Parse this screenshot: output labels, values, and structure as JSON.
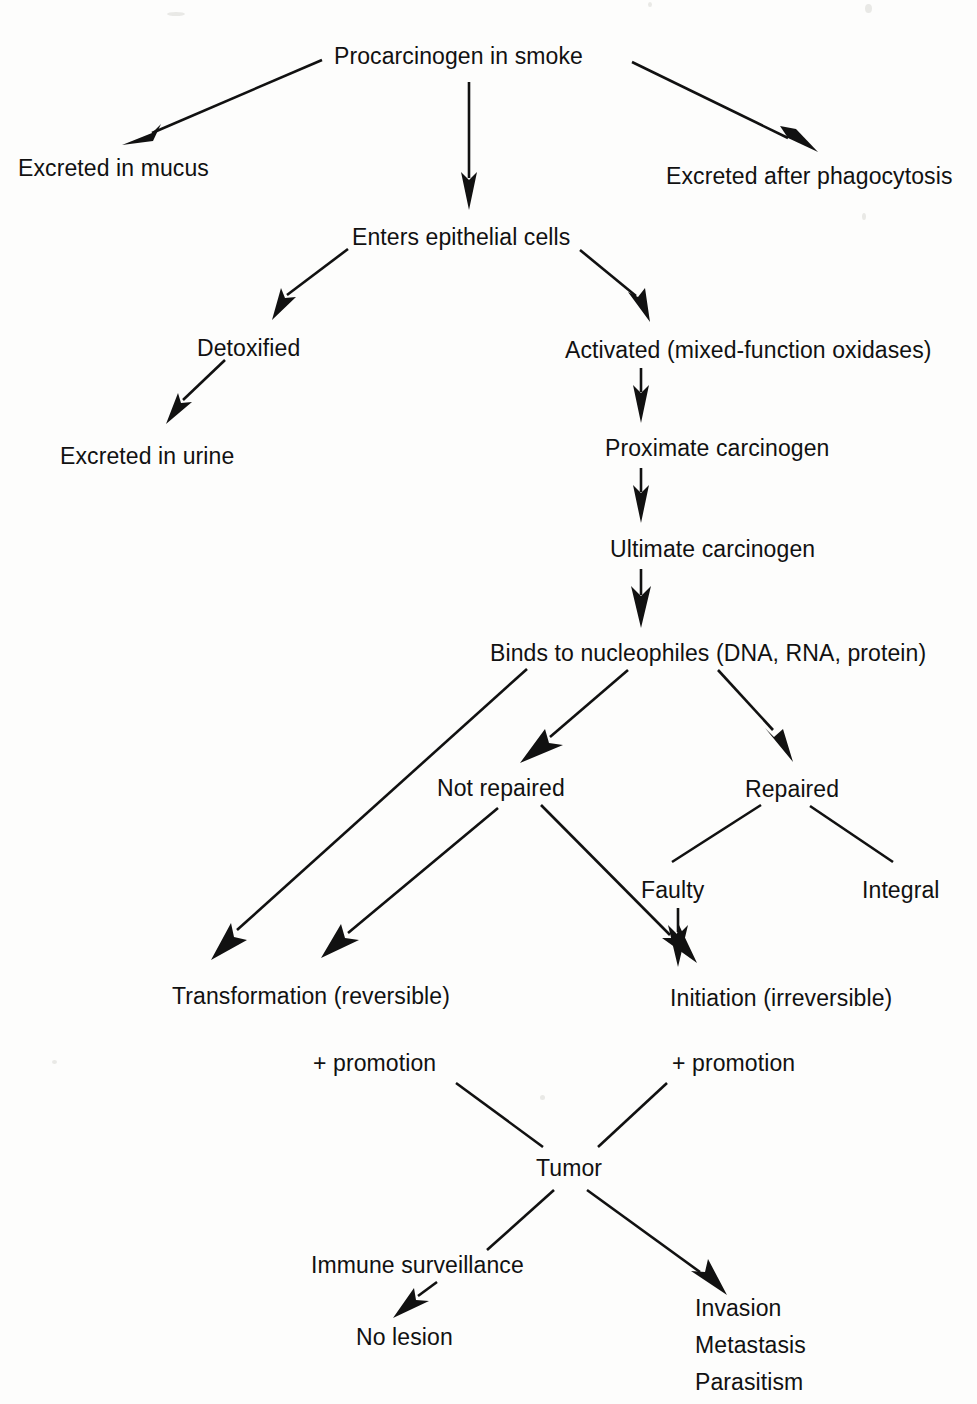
{
  "diagram": {
    "type": "flowchart",
    "ink_color": "#111111",
    "background_color": "#fdfdfc",
    "nodes": [
      {
        "id": "procarcinogen",
        "label": "Procarcinogen in smoke",
        "x": 334,
        "y": 45,
        "anchor": "left"
      },
      {
        "id": "mucus",
        "label": "Excreted in mucus",
        "x": 18,
        "y": 157,
        "anchor": "left"
      },
      {
        "id": "phagocytosis",
        "label": "Excreted after phagocytosis",
        "x": 666,
        "y": 165,
        "anchor": "left"
      },
      {
        "id": "epithelial",
        "label": "Enters epithelial cells",
        "x": 352,
        "y": 226,
        "anchor": "left"
      },
      {
        "id": "detoxified",
        "label": "Detoxified",
        "x": 197,
        "y": 337,
        "anchor": "left"
      },
      {
        "id": "activated",
        "label": "Activated (mixed-function oxidases)",
        "x": 565,
        "y": 339,
        "anchor": "left"
      },
      {
        "id": "urine",
        "label": "Excreted in urine",
        "x": 60,
        "y": 445,
        "anchor": "left"
      },
      {
        "id": "proximate",
        "label": "Proximate carcinogen",
        "x": 605,
        "y": 437,
        "anchor": "left"
      },
      {
        "id": "ultimate",
        "label": "Ultimate carcinogen",
        "x": 610,
        "y": 538,
        "anchor": "left"
      },
      {
        "id": "binds",
        "label": "Binds to nucleophiles (DNA, RNA, protein)",
        "x": 490,
        "y": 642,
        "anchor": "left"
      },
      {
        "id": "not_repaired",
        "label": "Not repaired",
        "x": 437,
        "y": 777,
        "anchor": "left"
      },
      {
        "id": "repaired",
        "label": "Repaired",
        "x": 745,
        "y": 778,
        "anchor": "left"
      },
      {
        "id": "faulty",
        "label": "Faulty",
        "x": 641,
        "y": 879,
        "anchor": "left"
      },
      {
        "id": "integral",
        "label": "Integral",
        "x": 862,
        "y": 879,
        "anchor": "left"
      },
      {
        "id": "transformation",
        "label": "Transformation (reversible)",
        "x": 172,
        "y": 985,
        "anchor": "left"
      },
      {
        "id": "initiation",
        "label": "Initiation (irreversible)",
        "x": 670,
        "y": 987,
        "anchor": "left"
      },
      {
        "id": "promotion_left",
        "label": "+ promotion",
        "x": 313,
        "y": 1052,
        "anchor": "left"
      },
      {
        "id": "promotion_right",
        "label": "+ promotion",
        "x": 672,
        "y": 1052,
        "anchor": "left"
      },
      {
        "id": "tumor",
        "label": "Tumor",
        "x": 536,
        "y": 1157,
        "anchor": "left"
      },
      {
        "id": "immune",
        "label": "Immune surveillance",
        "x": 311,
        "y": 1254,
        "anchor": "left"
      },
      {
        "id": "no_lesion",
        "label": "No lesion",
        "x": 356,
        "y": 1326,
        "anchor": "left"
      },
      {
        "id": "invasion",
        "label": "Invasion",
        "x": 695,
        "y": 1297,
        "anchor": "left"
      },
      {
        "id": "metastasis",
        "label": "Metastasis",
        "x": 695,
        "y": 1334,
        "anchor": "left"
      },
      {
        "id": "parasitism",
        "label": "Parasitism",
        "x": 695,
        "y": 1371,
        "anchor": "left"
      }
    ],
    "edges": [
      {
        "id": "e-proc-mucus",
        "from": "procarcinogen",
        "to": "mucus",
        "arrowhead": true
      },
      {
        "id": "e-proc-phago",
        "from": "procarcinogen",
        "to": "phagocytosis",
        "arrowhead": true
      },
      {
        "id": "e-proc-epi",
        "from": "procarcinogen",
        "to": "epithelial",
        "arrowhead": true
      },
      {
        "id": "e-epi-detox",
        "from": "epithelial",
        "to": "detoxified",
        "arrowhead": true
      },
      {
        "id": "e-epi-activated",
        "from": "epithelial",
        "to": "activated",
        "arrowhead": true
      },
      {
        "id": "e-detox-urine",
        "from": "detoxified",
        "to": "urine",
        "arrowhead": true
      },
      {
        "id": "e-activated-prox",
        "from": "activated",
        "to": "proximate",
        "arrowhead": true
      },
      {
        "id": "e-prox-ult",
        "from": "proximate",
        "to": "ultimate",
        "arrowhead": true
      },
      {
        "id": "e-ult-binds",
        "from": "ultimate",
        "to": "binds",
        "arrowhead": true
      },
      {
        "id": "e-binds-transform",
        "from": "binds",
        "to": "transformation",
        "arrowhead": true
      },
      {
        "id": "e-binds-notrep",
        "from": "binds",
        "to": "not_repaired",
        "arrowhead": true
      },
      {
        "id": "e-binds-rep",
        "from": "binds",
        "to": "repaired",
        "arrowhead": true
      },
      {
        "id": "e-notrep-transform",
        "from": "not_repaired",
        "to": "transformation",
        "arrowhead": true
      },
      {
        "id": "e-notrep-init",
        "from": "not_repaired",
        "to": "initiation",
        "arrowhead": true
      },
      {
        "id": "e-rep-faulty",
        "from": "repaired",
        "to": "faulty",
        "arrowhead": false
      },
      {
        "id": "e-rep-integral",
        "from": "repaired",
        "to": "integral",
        "arrowhead": false
      },
      {
        "id": "e-faulty-init",
        "from": "faulty",
        "to": "initiation",
        "arrowhead": true
      },
      {
        "id": "e-transform-promo",
        "from": "transformation",
        "to": "promotion_left",
        "arrowhead": false
      },
      {
        "id": "e-init-promo",
        "from": "initiation",
        "to": "promotion_right",
        "arrowhead": false
      },
      {
        "id": "e-promoleft-tumor",
        "from": "promotion_left",
        "to": "tumor",
        "arrowhead": false
      },
      {
        "id": "e-promoright-tumor",
        "from": "promotion_right",
        "to": "tumor",
        "arrowhead": false
      },
      {
        "id": "e-tumor-immune",
        "from": "tumor",
        "to": "immune",
        "arrowhead": false
      },
      {
        "id": "e-tumor-invasion",
        "from": "tumor",
        "to": "invasion",
        "arrowhead": true
      },
      {
        "id": "e-immune-nolesion",
        "from": "immune",
        "to": "no_lesion",
        "arrowhead": true
      }
    ]
  }
}
